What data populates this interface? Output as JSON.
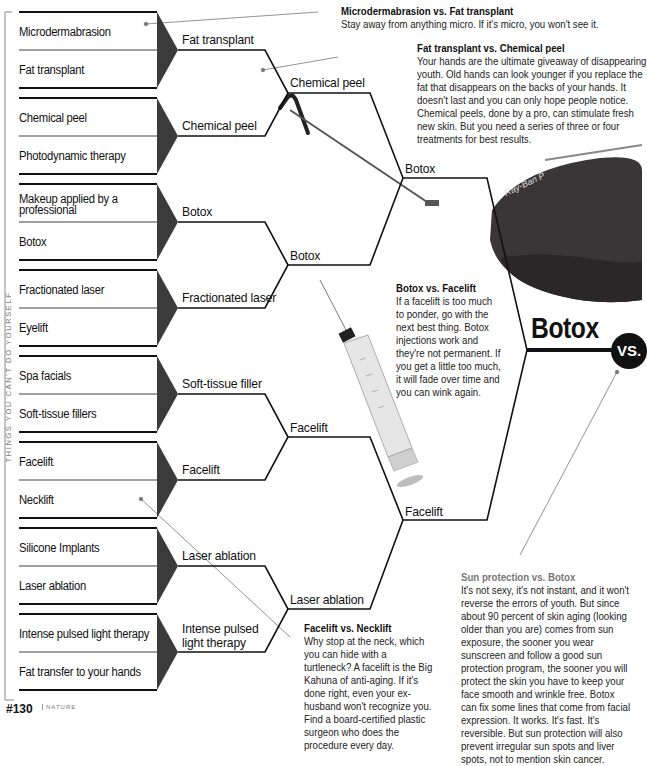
{
  "side_label": "THINGS YOU CAN'T DO YOURSELF",
  "footer": {
    "page_number": "#130",
    "source": "NATURE"
  },
  "round1": [
    [
      "Microdermabrasion",
      "Fat transplant"
    ],
    [
      "Chemical peel",
      "Photodynamic therapy"
    ],
    [
      "Makeup applied by a professional",
      "Botox"
    ],
    [
      "Fractionated laser",
      "Eyelift"
    ],
    [
      "Spa facials",
      "Soft-tissue fillers"
    ],
    [
      "Facelift",
      "Necklift"
    ],
    [
      "Silicone Implants",
      "Laser ablation"
    ],
    [
      "Intense pulsed light therapy",
      "Fat transfer to your hands"
    ]
  ],
  "round2": [
    "Fat transplant",
    "Chemical peel",
    "Botox",
    "Fractionated laser",
    "Soft-tissue filler",
    "Facelift",
    "Laser ablation",
    "Intense pulsed light therapy"
  ],
  "round3": [
    "Chemical peel",
    "Botox",
    "Facelift",
    "Laser ablation"
  ],
  "round4": [
    "Botox",
    "Facelift"
  ],
  "winner": "Botox",
  "vs_label": "VS.",
  "notes": [
    {
      "title": "Microdermabrasion vs. Fat transplant",
      "body": "Stay away from anything micro. If it's micro, you won't see it."
    },
    {
      "title": "Fat transplant vs. Chemical peel",
      "body": "Your hands are the ultimate giveaway of disappearing youth. Old hands can look younger if you replace the fat that disappears on the backs of your hands. It doesn't last and you can only hope people notice. Chemical peels, done by a pro, can stimulate fresh new skin. But you need a series of three or four treatments for best results."
    },
    {
      "title": "Botox vs. Facelift",
      "body": "If a facelift is too much to ponder, go with the next best thing. Botox injections work and they're not permanent. If you get a little too much, it will fade over time and you can wink again."
    },
    {
      "title": "Facelift vs. Necklift",
      "body": "Why stop at the neck, which you can hide with a turtleneck? A facelift is the Big Kahuna of anti-aging. If it's done right, even your ex-husband won't recognize you. Find a board-certified plastic surgeon who does the procedure every day."
    },
    {
      "title": "Sun protection vs. Botox",
      "body": "It's not sexy, it's not instant, and it won't reverse the errors of youth. But since about 90 percent of skin aging (looking older than you are) comes from sun exposure, the sooner you wear sunscreen and follow a good sun protection program, the sooner you will protect the skin you have to keep your face smooth and wrinkle free. Botox can fix some lines that come from facial expression. It works. It's fast. It's reversible. But sun protection will also prevent irregular sun spots and liver spots, not to mention skin cancer."
    }
  ],
  "images": {
    "sunglasses_brand": "Ray-Ban P"
  }
}
